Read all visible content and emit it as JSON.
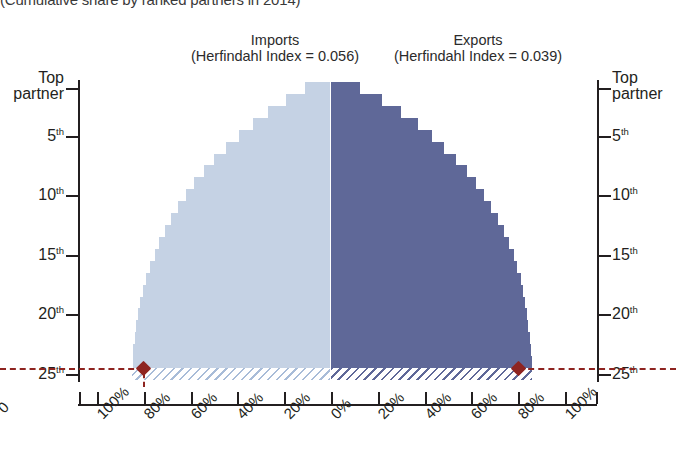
{
  "title": "(Cumulative share by ranked partners in 2014)",
  "headers": {
    "imports": {
      "name": "Imports",
      "sub": "(Herfindahl Index = 0.056)"
    },
    "exports": {
      "name": "Exports",
      "sub": "(Herfindahl Index = 0.039)"
    }
  },
  "colors": {
    "imports_fill": "#c5d2e4",
    "exports_fill": "#5f6898",
    "marker": "#8e2420",
    "axis": "#231f20"
  },
  "axis": {
    "y_labels": [
      "Top partner",
      "5th",
      "10th",
      "15th",
      "20th",
      "25th"
    ],
    "y_label_top_line1": "Top",
    "y_label_top_line2": "partner",
    "x_labels_left": [
      "100%",
      "80%",
      "60%",
      "40%",
      "20%",
      "0%"
    ],
    "x_labels_right": [
      "20%",
      "40%",
      "60%",
      "80%",
      "100%"
    ],
    "stray_label": "0"
  },
  "markers": {
    "imports_value": 80,
    "exports_value": 80,
    "rank": 25
  },
  "chart_data": {
    "type": "bar",
    "orientation": "horizontal-diverging",
    "title": "(Cumulative share by ranked partners in 2014)",
    "xlabel": "",
    "ylabel": "",
    "xlim": [
      0,
      100
    ],
    "grid": false,
    "legend_position": "top",
    "categories": [
      "Top partner",
      "2nd",
      "3rd",
      "4th",
      "5th",
      "6th",
      "7th",
      "8th",
      "9th",
      "10th",
      "11th",
      "12th",
      "13th",
      "14th",
      "15th",
      "16th",
      "17th",
      "18th",
      "19th",
      "20th",
      "21st",
      "22nd",
      "23rd",
      "24th",
      "25th"
    ],
    "series": [
      {
        "name": "Imports",
        "direction": "left",
        "herfindahl_index": 0.056,
        "color": "#c5d2e4",
        "values": [
          10.5,
          19.0,
          26.5,
          33.0,
          39.0,
          44.5,
          49.5,
          54.0,
          58.0,
          61.5,
          65.0,
          68.0,
          70.5,
          73.0,
          75.0,
          77.0,
          78.5,
          80.0,
          81.0,
          82.0,
          82.8,
          83.4,
          84.0,
          84.4,
          84.8
        ],
        "hatched_rows": [
          "25th"
        ],
        "marker_rank": "25th",
        "marker_value": 80
      },
      {
        "name": "Exports",
        "direction": "right",
        "herfindahl_index": 0.039,
        "color": "#5f6898",
        "values": [
          12.5,
          22.0,
          30.0,
          37.0,
          43.0,
          48.5,
          53.5,
          58.0,
          62.0,
          65.5,
          68.5,
          71.5,
          74.0,
          76.0,
          78.0,
          79.5,
          81.0,
          82.0,
          83.0,
          83.8,
          84.4,
          85.0,
          85.4,
          85.8,
          86.0
        ],
        "hatched_rows": [
          "25th"
        ],
        "marker_rank": "25th",
        "marker_value": 80
      }
    ]
  }
}
